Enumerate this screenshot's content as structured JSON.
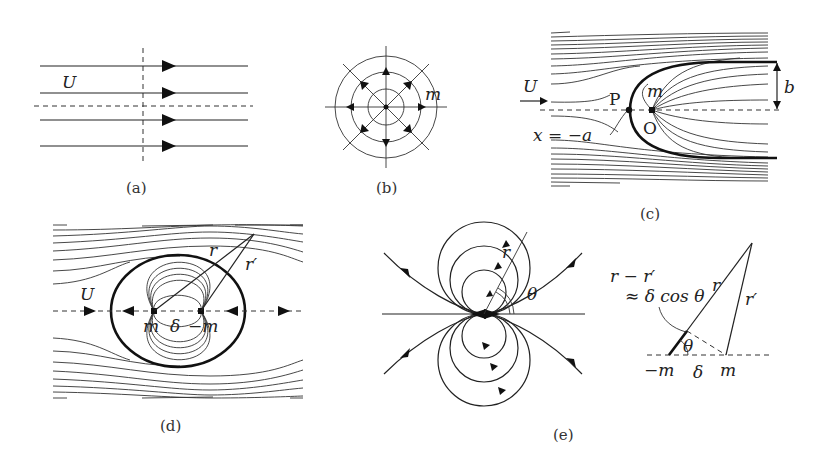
{
  "figure": {
    "panels": [
      {
        "id": "a",
        "caption": "(a)",
        "title": "Uniform flow",
        "labels": {
          "velocity": "U"
        }
      },
      {
        "id": "b",
        "caption": "(b)",
        "title": "Source",
        "labels": {
          "strength": "m"
        }
      },
      {
        "id": "c",
        "caption": "(c)",
        "title": "Rankine half-body",
        "labels": {
          "velocity": "U",
          "stagnation_point": "P",
          "source": "m",
          "origin": "O",
          "position": "x = −a",
          "half_width": "b"
        }
      },
      {
        "id": "d",
        "caption": "(d)",
        "title": "Rankine oval (source-sink pair in uniform flow)",
        "labels": {
          "velocity": "U",
          "r": "r",
          "r_prime": "r′",
          "source": "m",
          "spacing": "δ",
          "sink": "−m"
        }
      },
      {
        "id": "e",
        "caption": "(e)",
        "title": "Doublet",
        "labels": {
          "r": "r",
          "theta": "θ"
        },
        "inset": {
          "line1": "r − r′",
          "line2": "≈ δ cos θ",
          "r": "r",
          "r_prime": "r′",
          "theta": "θ",
          "sink": "−m",
          "spacing": "δ",
          "source": "m"
        }
      }
    ]
  }
}
